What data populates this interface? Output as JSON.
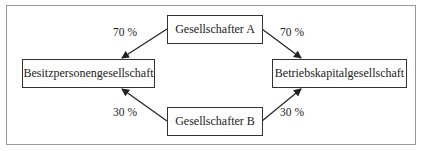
{
  "diagram": {
    "nodes": {
      "shareholder_a": "Gesellschafter A",
      "shareholder_b": "Gesellschafter B",
      "holding_company": "Besitzpersonengesellschaft",
      "operating_company": "Betriebskapitalgesellschaft"
    },
    "edges": [
      {
        "from": "Gesellschafter A",
        "to": "Besitzpersonengesellschaft",
        "label": "70 %"
      },
      {
        "from": "Gesellschafter A",
        "to": "Betriebskapitalgesellschaft",
        "label": "70 %"
      },
      {
        "from": "Gesellschafter B",
        "to": "Besitzpersonengesellschaft",
        "label": "30 %"
      },
      {
        "from": "Gesellschafter B",
        "to": "Betriebskapitalgesellschaft",
        "label": "30 %"
      }
    ],
    "colors": {
      "line": "#222222",
      "frame": "#9a9a9a"
    }
  }
}
